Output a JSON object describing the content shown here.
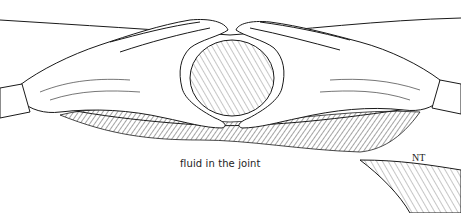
{
  "illustration": {
    "subject": "two hands cupping a swollen knee to palpate joint effusion",
    "style": "black ink line drawing with hatching",
    "caption": "fluid in the joint",
    "signature": "NT",
    "colors": {
      "ink": "#1a1a1a",
      "background": "#ffffff"
    }
  }
}
